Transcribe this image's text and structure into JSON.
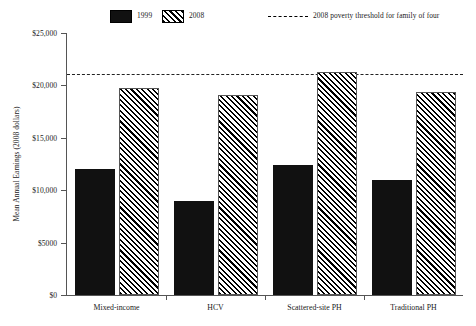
{
  "chart_data": {
    "type": "bar",
    "title": "",
    "xlabel": "",
    "ylabel": "Mean Annual Earnings (2008 dollars)",
    "categories": [
      "Mixed-income",
      "HCV",
      "Scattered-site PH",
      "Traditional PH"
    ],
    "series": [
      {
        "name": "1999",
        "values": [
          12000,
          9000,
          12400,
          11000
        ],
        "style": "solid-black"
      },
      {
        "name": "2008",
        "values": [
          19800,
          19100,
          21300,
          19400
        ],
        "style": "diagonal-hatch"
      }
    ],
    "ylim": [
      0,
      25000
    ],
    "yticks": [
      0,
      5000,
      10000,
      15000,
      20000,
      25000
    ],
    "ytick_labels": [
      "$0",
      "$5000",
      "$10,000",
      "$15,000",
      "$20,000",
      "$25,000"
    ],
    "grid": false,
    "legend_position": "top",
    "annotations": [
      {
        "type": "hline",
        "label": "2008 poverty threshold for family of four",
        "value": 21100,
        "style": "dashed"
      }
    ],
    "colors": {
      "series_1999": "#111111",
      "series_2008_hatch": "#000000",
      "background": "#ffffff",
      "axis": "#555555",
      "threshold_line": "#222222"
    }
  },
  "legend": {
    "entries": [
      {
        "label": "1999",
        "swatch": "solid-black-swatch"
      },
      {
        "label": "2008",
        "swatch": "hatched-swatch"
      },
      {
        "label": "2008 poverty threshold for family of four",
        "swatch": "dashed-line-swatch"
      }
    ]
  }
}
